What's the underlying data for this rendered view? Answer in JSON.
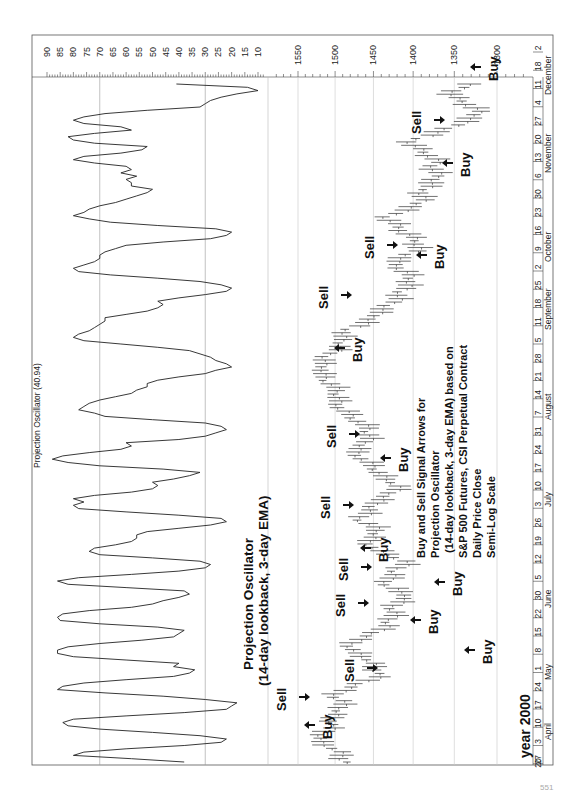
{
  "page": {
    "orientation": "rotated-90-ccw",
    "page_number": "551"
  },
  "chart_data": [
    {
      "type": "line",
      "title": "Projection Oscillator (40.94)",
      "annotation": [
        "Projection Oscillator",
        "(14-day lookback, 3-day EMA)"
      ],
      "ylabel": "Projection Oscillator",
      "yticks": [
        90,
        85,
        80,
        75,
        70,
        65,
        60,
        55,
        50,
        45,
        40,
        35,
        30,
        25,
        20,
        15,
        10
      ],
      "ylim": [
        10,
        90
      ],
      "reference_lines": [
        70,
        30
      ],
      "last_value": 40.94,
      "x_note": "daily, 2000-03-20 to 2000-12-29",
      "values": [
        38,
        58,
        80,
        76,
        60,
        38,
        24,
        22,
        32,
        50,
        70,
        82,
        84,
        80,
        60,
        38,
        22,
        20,
        18,
        30,
        46,
        68,
        86,
        84,
        76,
        60,
        42,
        36,
        34,
        42,
        40,
        60,
        80,
        86,
        86,
        82,
        70,
        54,
        42,
        40,
        38,
        48,
        70,
        85,
        86,
        84,
        74,
        58,
        50,
        46,
        40,
        36,
        38,
        60,
        82,
        86,
        78,
        58,
        40,
        30,
        28,
        32,
        50,
        70,
        74,
        72,
        64,
        58,
        56,
        56,
        52,
        40,
        28,
        22,
        24,
        40,
        60,
        78,
        80,
        76,
        80,
        72,
        58,
        50,
        48,
        50,
        42,
        36,
        32,
        46,
        70,
        82,
        88,
        84,
        74,
        62,
        58,
        60,
        40,
        30,
        26,
        22,
        24,
        30,
        50,
        68,
        72,
        78,
        76,
        74,
        70,
        64,
        58,
        56,
        52,
        52,
        48,
        40,
        30,
        26,
        20,
        22,
        26,
        28,
        32,
        36,
        48,
        62,
        76,
        80,
        78,
        74,
        72,
        70,
        68,
        68,
        60,
        52,
        48,
        46,
        48,
        40,
        30,
        22,
        20,
        24,
        32,
        48,
        66,
        78,
        80,
        76,
        72,
        70,
        70,
        68,
        64,
        60,
        46,
        28,
        22,
        20,
        26,
        48,
        66,
        74,
        80,
        76,
        74,
        70,
        64,
        60,
        56,
        52,
        50,
        58,
        58,
        60,
        56,
        62,
        58,
        60,
        72,
        80,
        76,
        62,
        54,
        52,
        72,
        80,
        82,
        72,
        58,
        62,
        76,
        80,
        76,
        68,
        52,
        32,
        30,
        28,
        24,
        18,
        10,
        14,
        40.94
      ]
    },
    {
      "type": "ohlc",
      "title": "S&P 500 Futures, CSI Perpetual Contract - Daily Price Close",
      "scale": "semi-log",
      "ylabel": "Price",
      "yticks": [
        1550,
        1500,
        1450,
        1400,
        1350,
        1300
      ],
      "ylim": [
        1270,
        1600
      ],
      "xlabel": "year 2000",
      "x_ticks": [
        "20",
        "27",
        "3",
        "10",
        "17",
        "24",
        "1",
        "8",
        "15",
        "22",
        "30",
        "5",
        "12",
        "19",
        "26",
        "3",
        "10",
        "17",
        "24",
        "31",
        "7",
        "14",
        "21",
        "28",
        "5",
        "11",
        "18",
        "25",
        "2",
        "9",
        "16",
        "23",
        "30",
        "6",
        "13",
        "20",
        "27",
        "4",
        "11",
        "18",
        "2"
      ],
      "months": [
        "April",
        "May",
        "June",
        "July",
        "August",
        "September",
        "October",
        "November",
        "December"
      ],
      "annotation": [
        "Buy and Sell Signal Arrows for",
        "Projection Oscillator",
        "(14-day lookback, 3-day EMA) based on",
        "S&P 500 Futures, CSI Perpetual Contract",
        "Daily Price Close",
        "Semi-Log Scale"
      ],
      "approx_close": [
        1480,
        1500,
        1520,
        1510,
        1500,
        1490,
        1500,
        1470,
        1440,
        1450,
        1480,
        1470,
        1440,
        1420,
        1430,
        1400,
        1440,
        1420,
        1410,
        1440,
        1460,
        1440,
        1470,
        1450,
        1430,
        1420,
        1440,
        1460,
        1470,
        1460,
        1450,
        1480,
        1490,
        1500,
        1500,
        1520,
        1515,
        1500,
        1490,
        1480,
        1450,
        1430,
        1420,
        1400,
        1410,
        1420,
        1400,
        1390,
        1420,
        1430,
        1400,
        1385,
        1380,
        1370,
        1370,
        1390,
        1400,
        1360,
        1320,
        1330,
        1350,
        1340
      ],
      "signals": [
        {
          "type": "Buy",
          "date": "2000-03-30"
        },
        {
          "type": "Sell",
          "date": "2000-04-07"
        },
        {
          "type": "Buy",
          "date": "2000-04-14"
        },
        {
          "type": "Sell",
          "date": "2000-04-21"
        },
        {
          "type": "Buy",
          "date": "2000-05-04"
        },
        {
          "type": "Sell",
          "date": "2000-05-12"
        },
        {
          "type": "Buy",
          "date": "2000-05-24"
        },
        {
          "type": "Sell",
          "date": "2000-06-01"
        },
        {
          "type": "Buy",
          "date": "2000-06-08"
        },
        {
          "type": "Sell",
          "date": "2000-07-05"
        },
        {
          "type": "Buy",
          "date": "2000-07-25"
        },
        {
          "type": "Sell",
          "date": "2000-07-28"
        },
        {
          "type": "Buy",
          "date": "2000-09-01"
        },
        {
          "type": "Sell",
          "date": "2000-09-01"
        },
        {
          "type": "Buy",
          "date": "2000-10-13"
        },
        {
          "type": "Sell",
          "date": "2000-10-16"
        },
        {
          "type": "Buy",
          "date": "2000-11-08"
        },
        {
          "type": "Sell",
          "date": "2000-11-24"
        },
        {
          "type": "Buy",
          "date": "2000-12-19"
        }
      ]
    }
  ],
  "labels": {
    "osc_title": "Projection Oscillator (40.94)",
    "osc_ann_1": "Projection Oscillator",
    "osc_ann_2": "(14-day lookback, 3-day EMA)",
    "year": "year 2000",
    "desc": [
      "Buy and Sell Signal Arrows for",
      "Projection Oscillator",
      "(14-day lookback, 3-day EMA) based on",
      "S&P 500 Futures, CSI Perpetual Contract",
      "Daily Price Close",
      "Semi-Log Scale"
    ],
    "buy": "Buy",
    "sell": "Sell"
  },
  "colors": {
    "line": "#222222",
    "grid": "#999999",
    "frame": "#555555",
    "background": "#ffffff"
  }
}
